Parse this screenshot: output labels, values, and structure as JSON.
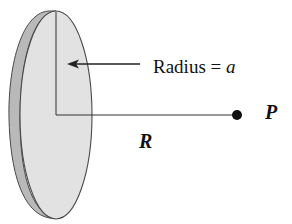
{
  "diagram": {
    "labels": {
      "radius_prefix": "Radius = ",
      "radius_var": "a",
      "point": "P",
      "distance": "R"
    },
    "colors": {
      "disk_face": "#e2e2e2",
      "disk_edge": "#b9b9b9",
      "outline": "#4a4a4a",
      "line": "#333333",
      "point": "#111111",
      "background": "#ffffff"
    }
  }
}
